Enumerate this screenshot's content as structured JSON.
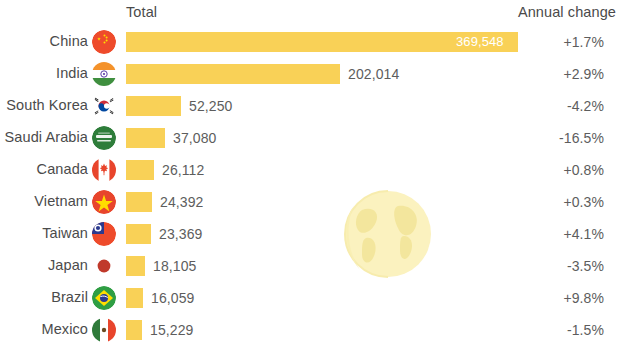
{
  "header": {
    "total_label": "Total",
    "change_label": "Annual change"
  },
  "colors": {
    "bar": "#f9d157",
    "text": "#4b4b4b",
    "value_text": "#5d5d5d",
    "inside_value_text": "#ffffff",
    "background": "#ffffff",
    "watermark": "#f7e9a8"
  },
  "chart_data": {
    "type": "bar",
    "title": "",
    "subtitle": "",
    "xlabel": "",
    "ylabel": "",
    "orientation": "horizontal",
    "grid": false,
    "legend": "none",
    "xlim": [
      0,
      369548
    ],
    "categories": [
      "China",
      "India",
      "South Korea",
      "Saudi Arabia",
      "Canada",
      "Vietnam",
      "Taiwan",
      "Japan",
      "Brazil",
      "Mexico"
    ],
    "values": [
      369548,
      202014,
      52250,
      37080,
      26112,
      24392,
      23369,
      18105,
      16059,
      15229
    ],
    "value_labels": [
      "369,548",
      "202,014",
      "52,250",
      "37,080",
      "26,112",
      "24,392",
      "23,369",
      "18,105",
      "16,059",
      "15,229"
    ],
    "series": [
      {
        "name": "Total",
        "values": [
          369548,
          202014,
          52250,
          37080,
          26112,
          24392,
          23369,
          18105,
          16059,
          15229
        ]
      },
      {
        "name": "Annual change",
        "values": [
          1.7,
          2.9,
          -4.2,
          -16.5,
          0.8,
          0.3,
          4.1,
          -3.5,
          9.8,
          -1.5
        ]
      }
    ],
    "annual_change_labels": [
      "+1.7%",
      "+2.9%",
      "-4.2%",
      "-16.5%",
      "+0.8%",
      "+0.3%",
      "+4.1%",
      "-3.5%",
      "+9.8%",
      "-1.5%"
    ]
  },
  "rows": [
    {
      "country": "China",
      "flag": "flag-china",
      "value": "369,548",
      "change": "+1.7%",
      "num": 369548,
      "label_inside": true
    },
    {
      "country": "India",
      "flag": "flag-india",
      "value": "202,014",
      "change": "+2.9%",
      "num": 202014,
      "label_inside": false
    },
    {
      "country": "South Korea",
      "flag": "flag-south-korea",
      "value": "52,250",
      "change": "-4.2%",
      "num": 52250,
      "label_inside": false
    },
    {
      "country": "Saudi Arabia",
      "flag": "flag-saudi-arabia",
      "value": "37,080",
      "change": "-16.5%",
      "num": 37080,
      "label_inside": false
    },
    {
      "country": "Canada",
      "flag": "flag-canada",
      "value": "26,112",
      "change": "+0.8%",
      "num": 26112,
      "label_inside": false
    },
    {
      "country": "Vietnam",
      "flag": "flag-vietnam",
      "value": "24,392",
      "change": "+0.3%",
      "num": 24392,
      "label_inside": false
    },
    {
      "country": "Taiwan",
      "flag": "flag-taiwan",
      "value": "23,369",
      "change": "+4.1%",
      "num": 23369,
      "label_inside": false
    },
    {
      "country": "Japan",
      "flag": "flag-japan",
      "value": "18,105",
      "change": "-3.5%",
      "num": 18105,
      "label_inside": false
    },
    {
      "country": "Brazil",
      "flag": "flag-brazil",
      "value": "16,059",
      "change": "+9.8%",
      "num": 16059,
      "label_inside": false
    },
    {
      "country": "Mexico",
      "flag": "flag-mexico",
      "value": "15,229",
      "change": "-1.5%",
      "num": 15229,
      "label_inside": false
    }
  ],
  "watermark": {
    "icon": "globe-icon"
  }
}
